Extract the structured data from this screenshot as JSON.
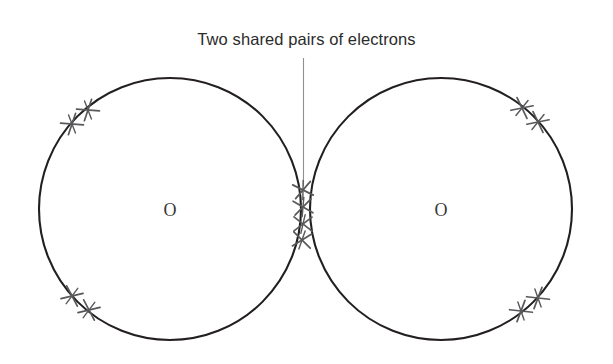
{
  "figure": {
    "title_note": "Two shared pairs of electrons",
    "atom_labels": [
      "O",
      "O"
    ],
    "molecule": "O2",
    "background_color": "#ffffff",
    "circle_stroke_color": "#231f20",
    "electron_mark_color": "#58595b",
    "leader_line_color": "#808285",
    "text_color": "#2b2b2b",
    "atom_label_color": "#3a3a3a",
    "electron_symbol": "x",
    "circles": [
      {
        "name": "left-oxygen-shell",
        "cx": 170,
        "cy": 209,
        "r": 131
      },
      {
        "name": "right-oxygen-shell",
        "cx": 441,
        "cy": 209,
        "r": 131
      }
    ],
    "electron_groups": [
      {
        "name": "shared-pair-electrons",
        "count": 4,
        "location": "center"
      },
      {
        "name": "left-upper-lone-pair",
        "count": 2,
        "location": "upper-left"
      },
      {
        "name": "left-lower-lone-pair",
        "count": 2,
        "location": "lower-left"
      },
      {
        "name": "right-upper-lone-pair",
        "count": 2,
        "location": "upper-right"
      },
      {
        "name": "right-lower-lone-pair",
        "count": 2,
        "location": "lower-right"
      }
    ],
    "leader_line": {
      "x": 303,
      "y_top": 58,
      "y_bottom": 186
    }
  }
}
